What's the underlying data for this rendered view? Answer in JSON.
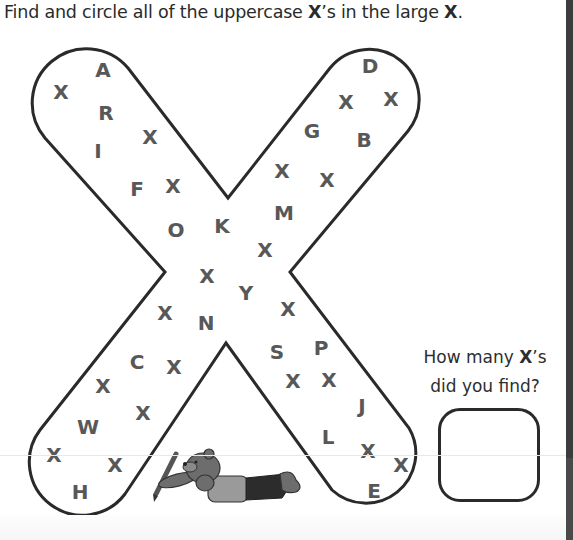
{
  "instruction": {
    "prefix": "Find and circle all of the uppercase ",
    "bold1": "X",
    "middle": "’s in the large ",
    "bold2": "X",
    "suffix": "."
  },
  "question": {
    "line1_prefix": "How many ",
    "line1_bold": "X",
    "line1_suffix": "’s",
    "line2": "did you find?"
  },
  "answer_box": {
    "value": ""
  },
  "illustration": {
    "description": "bear lying down holding a pencil"
  },
  "letters": [
    {
      "char": "A",
      "x": 103,
      "y": 70
    },
    {
      "char": "X",
      "x": 61,
      "y": 92
    },
    {
      "char": "R",
      "x": 106,
      "y": 113
    },
    {
      "char": "X",
      "x": 150,
      "y": 137
    },
    {
      "char": "I",
      "x": 98,
      "y": 151
    },
    {
      "char": "F",
      "x": 137,
      "y": 189
    },
    {
      "char": "X",
      "x": 173,
      "y": 186
    },
    {
      "char": "O",
      "x": 176,
      "y": 230
    },
    {
      "char": "K",
      "x": 222,
      "y": 226
    },
    {
      "char": "D",
      "x": 370,
      "y": 66
    },
    {
      "char": "X",
      "x": 346,
      "y": 102
    },
    {
      "char": "X",
      "x": 391,
      "y": 99
    },
    {
      "char": "G",
      "x": 312,
      "y": 131
    },
    {
      "char": "B",
      "x": 364,
      "y": 140
    },
    {
      "char": "X",
      "x": 282,
      "y": 171
    },
    {
      "char": "X",
      "x": 327,
      "y": 180
    },
    {
      "char": "M",
      "x": 284,
      "y": 213
    },
    {
      "char": "X",
      "x": 265,
      "y": 250
    },
    {
      "char": "X",
      "x": 207,
      "y": 276
    },
    {
      "char": "Y",
      "x": 246,
      "y": 293
    },
    {
      "char": "X",
      "x": 165,
      "y": 313
    },
    {
      "char": "N",
      "x": 206,
      "y": 323
    },
    {
      "char": "X",
      "x": 288,
      "y": 309
    },
    {
      "char": "S",
      "x": 277,
      "y": 352
    },
    {
      "char": "P",
      "x": 321,
      "y": 348
    },
    {
      "char": "C",
      "x": 137,
      "y": 362
    },
    {
      "char": "X",
      "x": 174,
      "y": 367
    },
    {
      "char": "X",
      "x": 103,
      "y": 386
    },
    {
      "char": "X",
      "x": 293,
      "y": 381
    },
    {
      "char": "X",
      "x": 329,
      "y": 380
    },
    {
      "char": "X",
      "x": 143,
      "y": 413
    },
    {
      "char": "J",
      "x": 362,
      "y": 406
    },
    {
      "char": "W",
      "x": 88,
      "y": 427
    },
    {
      "char": "L",
      "x": 328,
      "y": 437
    },
    {
      "char": "X",
      "x": 54,
      "y": 455
    },
    {
      "char": "X",
      "x": 115,
      "y": 465
    },
    {
      "char": "X",
      "x": 368,
      "y": 451
    },
    {
      "char": "X",
      "x": 401,
      "y": 465
    },
    {
      "char": "H",
      "x": 80,
      "y": 492
    },
    {
      "char": "E",
      "x": 374,
      "y": 491
    }
  ],
  "colors": {
    "outline": "#2a2a2a",
    "letter": "#585858",
    "text": "#2a2a2a"
  }
}
